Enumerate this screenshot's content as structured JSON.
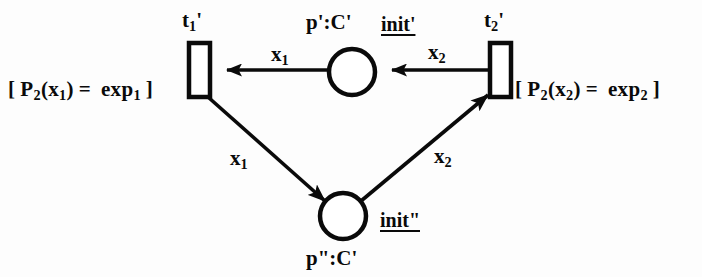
{
  "figure": {
    "type": "petri-net"
  },
  "transitions": [
    {
      "id": "t1",
      "name_base": "t",
      "name_sub": "1",
      "name_prime": "'",
      "guard_open": "[",
      "guard_lhs_fn": "P",
      "guard_lhs_sub": "2",
      "guard_lhs_arg_base": "(x",
      "guard_lhs_arg_sub": "1",
      "guard_lhs_arg_close": ")",
      "guard_eq": "=",
      "guard_rhs_base": "exp",
      "guard_rhs_sub": "1",
      "guard_close": "]"
    },
    {
      "id": "t2",
      "name_base": "t",
      "name_sub": "2",
      "name_prime": "'",
      "guard_open": "[",
      "guard_lhs_fn": "P",
      "guard_lhs_sub": "2",
      "guard_lhs_arg_base": "(x",
      "guard_lhs_arg_sub": "2",
      "guard_lhs_arg_close": ")",
      "guard_eq": "=",
      "guard_rhs_base": "exp",
      "guard_rhs_sub": "2",
      "guard_close": "]"
    }
  ],
  "places": [
    {
      "id": "p-top",
      "label": "p':C'",
      "init": "init'"
    },
    {
      "id": "p-bottom",
      "label": "p\":C'",
      "init": "init\""
    }
  ],
  "arcs": [
    {
      "id": "arc-top-left",
      "from": "p-top",
      "to": "t1",
      "label_base": "x",
      "label_sub": "1"
    },
    {
      "id": "arc-top-right",
      "from": "t2",
      "to": "p-top",
      "label_base": "x",
      "label_sub": "2"
    },
    {
      "id": "arc-bottom-left",
      "from": "t1",
      "to": "p-bottom",
      "label_base": "x",
      "label_sub": "1"
    },
    {
      "id": "arc-bottom-right",
      "from": "p-bottom",
      "to": "t2",
      "label_base": "x",
      "label_sub": "2"
    }
  ],
  "colors": {
    "ink": "#0a0a0a",
    "paper": "#fdfdfd"
  }
}
